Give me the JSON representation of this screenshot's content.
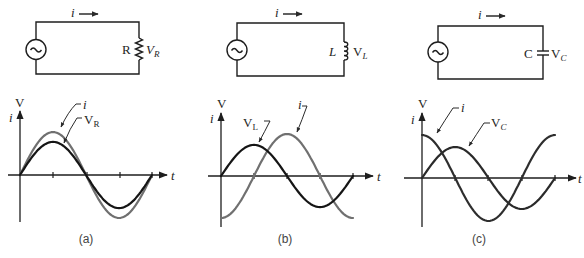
{
  "panels": [
    {
      "caption": "(a)",
      "circuit": {
        "source": "ac-source",
        "current_label": "i",
        "component_type": "resistor",
        "component_label": "R",
        "voltage_label": "V",
        "voltage_sub": "R"
      },
      "graph": {
        "y_label_top": "V",
        "y_label_side": "i",
        "x_label": "t",
        "curves": [
          {
            "name": "i",
            "label": "i",
            "sub": "",
            "shape": "sin",
            "rel_amplitude": 1.0,
            "color": "#707070"
          },
          {
            "name": "V_R",
            "label": "V",
            "sub": "R",
            "shape": "sin",
            "rel_amplitude": 0.77,
            "color": "#151515"
          }
        ]
      }
    },
    {
      "caption": "(b)",
      "circuit": {
        "source": "ac-source",
        "current_label": "i",
        "component_type": "inductor",
        "component_label": "L",
        "voltage_label": "V",
        "voltage_sub": "L"
      },
      "graph": {
        "y_label_top": "V",
        "y_label_side": "i",
        "x_label": "t",
        "curves": [
          {
            "name": "i",
            "label": "i",
            "sub": "",
            "shape": "-cos",
            "rel_amplitude": 1.0,
            "color": "#707070"
          },
          {
            "name": "V_L",
            "label": "V",
            "sub": "L",
            "shape": "sin",
            "rel_amplitude": 0.74,
            "color": "#151515"
          }
        ]
      }
    },
    {
      "caption": "(c)",
      "circuit": {
        "source": "ac-source",
        "current_label": "i",
        "component_type": "capacitor",
        "component_label": "C",
        "voltage_label": "V",
        "voltage_sub": "C"
      },
      "graph": {
        "y_label_top": "V",
        "y_label_side": "i",
        "x_label": "t",
        "curves": [
          {
            "name": "i",
            "label": "i",
            "sub": "",
            "shape": "cos",
            "rel_amplitude": 1.0,
            "color": "#2e2e2e"
          },
          {
            "name": "V_C",
            "label": "V",
            "sub": "C",
            "shape": "sin",
            "rel_amplitude": 0.72,
            "color": "#2a2a2a"
          }
        ]
      }
    }
  ]
}
